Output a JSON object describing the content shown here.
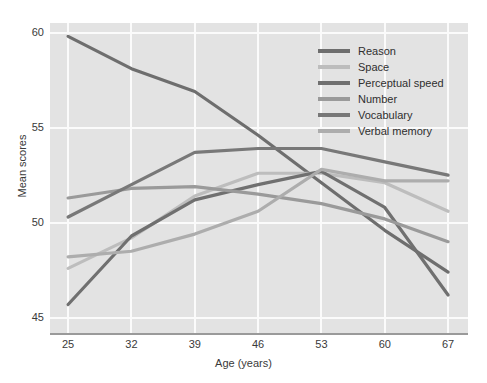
{
  "chart_data": {
    "type": "line",
    "title": "",
    "xlabel": "Age (years)",
    "ylabel": "Mean scores",
    "x": [
      25,
      32,
      39,
      46,
      53,
      60,
      67
    ],
    "xticklabels": [
      "25",
      "32",
      "39",
      "46",
      "53",
      "60",
      "67"
    ],
    "yticklabels": [
      "45",
      "50",
      "55",
      "60"
    ],
    "yticks": [
      45,
      50,
      55,
      60
    ],
    "ylim": [
      44.2,
      60.5
    ],
    "xlim": [
      23.0,
      69.2
    ],
    "grid": true,
    "legend_position": "upper right",
    "background": "#e3e3e3",
    "series": [
      {
        "name": "Reason",
        "color": "#6e6e6e",
        "values": [
          59.8,
          58.1,
          56.9,
          54.6,
          52.1,
          49.6,
          47.4
        ]
      },
      {
        "name": "Space",
        "color": "#bdbdbd",
        "values": [
          47.6,
          49.2,
          51.4,
          52.6,
          52.6,
          52.1,
          50.6
        ]
      },
      {
        "name": "Perceptual speed",
        "color": "#707070",
        "values": [
          45.7,
          49.3,
          51.2,
          52.0,
          52.7,
          50.8,
          46.2
        ]
      },
      {
        "name": "Number",
        "color": "#9a9a9a",
        "values": [
          51.3,
          51.8,
          51.9,
          51.5,
          51.0,
          50.2,
          49.0
        ]
      },
      {
        "name": "Vocabulary",
        "color": "#787878",
        "values": [
          50.3,
          52.0,
          53.7,
          53.9,
          53.9,
          53.2,
          52.5
        ]
      },
      {
        "name": "Verbal memory",
        "color": "#adadad",
        "values": [
          48.2,
          48.5,
          49.4,
          50.6,
          52.8,
          52.2,
          52.2
        ]
      }
    ]
  }
}
